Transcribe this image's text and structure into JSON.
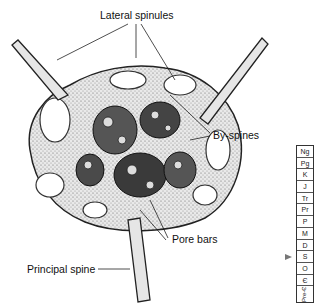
{
  "figure": {
    "labels": {
      "lateral_spinules": "Lateral spinules",
      "by_spines": "By-spines",
      "pore_bars": "Pore bars",
      "principal_spine": "Principal spine"
    }
  },
  "time_column": {
    "periods": [
      "Ng",
      "Pg",
      "K",
      "J",
      "Tr",
      "Pr",
      "P",
      "M",
      "D",
      "S",
      "O",
      "Є",
      "Pre-Є"
    ],
    "marker_at": "O",
    "marker_color": "#777777"
  }
}
